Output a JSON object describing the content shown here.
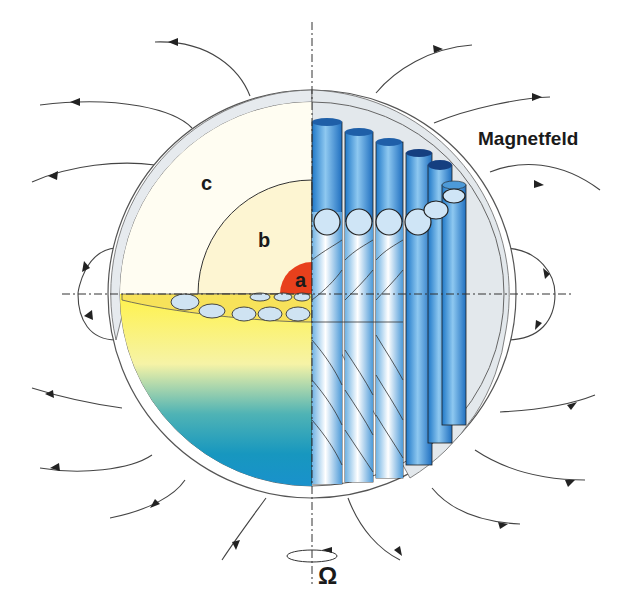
{
  "diagram": {
    "title": "Magnetfeld",
    "layers": [
      {
        "id": "a",
        "label": "a",
        "color": "#e8401c",
        "description": "inner core"
      },
      {
        "id": "b",
        "label": "b",
        "color": "#fdf5d3",
        "description": "outer core"
      },
      {
        "id": "c",
        "label": "c",
        "color": "#fffdf3",
        "description": "mantle"
      }
    ],
    "rotation_symbol": "Ω",
    "field_label": "Magnetfeld",
    "colors": {
      "crust": "#e3e8ec",
      "column_blue": "#2d8ad8",
      "column_light": "#e6f3fb",
      "gradient_top": "#fff04a",
      "gradient_bottom": "#1493c6",
      "core_red": "#e8401c",
      "field_line": "#333333"
    }
  }
}
